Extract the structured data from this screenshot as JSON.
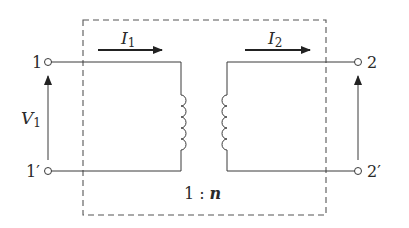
{
  "diagram": {
    "type": "ideal-transformer",
    "colors": {
      "line": "#3a3a3a",
      "dash": "#555555",
      "arrow": "#222222"
    },
    "terminals": {
      "primary_top": "1",
      "primary_bottom": "1′",
      "secondary_top": "2",
      "secondary_bottom": "2′"
    },
    "currents": {
      "primary": {
        "symbol": "I",
        "sub": "1"
      },
      "secondary": {
        "symbol": "I",
        "sub": "2"
      }
    },
    "voltages": {
      "primary": {
        "symbol": "V",
        "sub": "1"
      }
    },
    "ratio": {
      "left": "1",
      "sep": ":",
      "right": "n"
    }
  }
}
